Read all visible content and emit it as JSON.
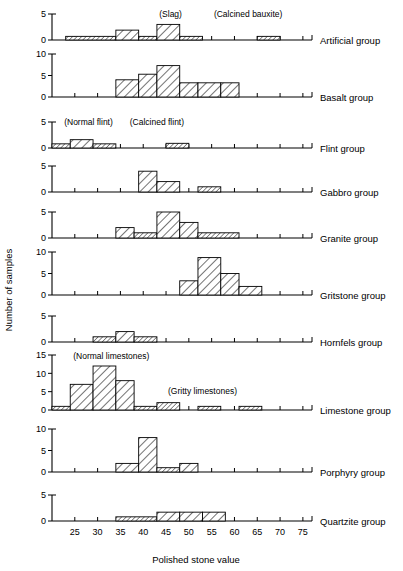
{
  "figure": {
    "xlabel": "Polished stone value",
    "ylabel": "Number of samples",
    "x_ticks": [
      25,
      30,
      35,
      40,
      45,
      50,
      55,
      60,
      65,
      70,
      75
    ],
    "x_range": [
      20,
      77
    ],
    "bin_width": 5
  },
  "chart_data": {
    "type": "bar",
    "title": "",
    "xlabel": "Polished stone value",
    "ylabel": "Number of samples",
    "xlim": [
      20,
      77
    ],
    "grid": false,
    "legend": "none",
    "xtick_labels": [
      "25",
      "30",
      "35",
      "40",
      "45",
      "50",
      "55",
      "60",
      "65",
      "70",
      "75"
    ],
    "panels": [
      {
        "name": "Artificial group",
        "label": "Artificial group",
        "ylim": [
          0,
          5
        ],
        "yticks": [
          0,
          5
        ],
        "ytick_labels": [
          "0",
          "5"
        ],
        "annotations": [
          {
            "text": "(Slag)",
            "x": 46,
            "y": 4.4
          },
          {
            "text": "(Calcined bauxite)",
            "x": 63,
            "y": 4.4
          }
        ],
        "bins": [
          {
            "x0": 23,
            "x1": 34,
            "value": 0.7
          },
          {
            "x0": 34,
            "x1": 39,
            "value": 1.9
          },
          {
            "x0": 39,
            "x1": 43,
            "value": 0.7
          },
          {
            "x0": 43,
            "x1": 48,
            "value": 3.0
          },
          {
            "x0": 48,
            "x1": 53,
            "value": 0.7
          },
          {
            "x0": 65,
            "x1": 70,
            "value": 0.7
          }
        ]
      },
      {
        "name": "Basalt group",
        "label": "Basalt group",
        "ylim": [
          0,
          10
        ],
        "yticks": [
          0,
          5,
          10
        ],
        "ytick_labels": [
          "0",
          "5",
          "10"
        ],
        "annotations": [],
        "bins": [
          {
            "x0": 34,
            "x1": 39,
            "value": 4.0
          },
          {
            "x0": 39,
            "x1": 43,
            "value": 5.3
          },
          {
            "x0": 43,
            "x1": 48,
            "value": 7.3
          },
          {
            "x0": 48,
            "x1": 52,
            "value": 3.3
          },
          {
            "x0": 52,
            "x1": 57,
            "value": 3.3
          },
          {
            "x0": 57,
            "x1": 61,
            "value": 3.3
          }
        ]
      },
      {
        "name": "Flint group",
        "label": "Flint group",
        "ylim": [
          0,
          5
        ],
        "yticks": [
          0,
          5
        ],
        "ytick_labels": [
          "0",
          "5"
        ],
        "annotations": [
          {
            "text": "(Normal flint)",
            "x": 28,
            "y": 4.4
          },
          {
            "text": "(Calcined flint)",
            "x": 43,
            "y": 4.4
          }
        ],
        "bins": [
          {
            "x0": 20,
            "x1": 24,
            "value": 0.8
          },
          {
            "x0": 24,
            "x1": 29,
            "value": 1.6
          },
          {
            "x0": 29,
            "x1": 34,
            "value": 0.8
          },
          {
            "x0": 45,
            "x1": 50,
            "value": 0.9
          }
        ]
      },
      {
        "name": "Gabbro group",
        "label": "Gabbro group",
        "ylim": [
          0,
          5
        ],
        "yticks": [
          0,
          5
        ],
        "ytick_labels": [
          "0",
          "5"
        ],
        "annotations": [],
        "bins": [
          {
            "x0": 39,
            "x1": 43,
            "value": 4.0
          },
          {
            "x0": 43,
            "x1": 48,
            "value": 2.0
          },
          {
            "x0": 52,
            "x1": 57,
            "value": 1.0
          }
        ]
      },
      {
        "name": "Granite group",
        "label": "Granite group",
        "ylim": [
          0,
          5
        ],
        "yticks": [
          0,
          5
        ],
        "ytick_labels": [
          "0",
          "5"
        ],
        "annotations": [],
        "bins": [
          {
            "x0": 34,
            "x1": 38,
            "value": 2.0
          },
          {
            "x0": 38,
            "x1": 43,
            "value": 1.0
          },
          {
            "x0": 43,
            "x1": 48,
            "value": 5.0
          },
          {
            "x0": 48,
            "x1": 52,
            "value": 3.0
          },
          {
            "x0": 52,
            "x1": 61,
            "value": 1.0
          }
        ]
      },
      {
        "name": "Gritstone group",
        "label": "Gritstone group",
        "ylim": [
          0,
          10
        ],
        "yticks": [
          0,
          5,
          10
        ],
        "ytick_labels": [
          "0",
          "5",
          "10"
        ],
        "annotations": [],
        "bins": [
          {
            "x0": 48,
            "x1": 52,
            "value": 3.3
          },
          {
            "x0": 52,
            "x1": 57,
            "value": 8.7
          },
          {
            "x0": 57,
            "x1": 61,
            "value": 5.0
          },
          {
            "x0": 61,
            "x1": 66,
            "value": 2.0
          }
        ]
      },
      {
        "name": "Hornfels group",
        "label": "Hornfels group",
        "ylim": [
          0,
          5
        ],
        "yticks": [
          0,
          5
        ],
        "ytick_labels": [
          "0",
          "5"
        ],
        "annotations": [],
        "bins": [
          {
            "x0": 29,
            "x1": 34,
            "value": 1.0
          },
          {
            "x0": 34,
            "x1": 38,
            "value": 2.0
          },
          {
            "x0": 38,
            "x1": 43,
            "value": 1.0
          }
        ]
      },
      {
        "name": "Limestone group",
        "label": "Limestone group",
        "ylim": [
          0,
          15
        ],
        "yticks": [
          0,
          5,
          10,
          15
        ],
        "ytick_labels": [
          "0",
          "5",
          "10",
          "15"
        ],
        "annotations": [
          {
            "text": "(Normal limestones)",
            "x": 33,
            "y": 14.0
          },
          {
            "text": "(Gritty limestones)",
            "x": 53,
            "y": 4.4
          }
        ],
        "bins": [
          {
            "x0": 20,
            "x1": 24,
            "value": 1.0
          },
          {
            "x0": 24,
            "x1": 29,
            "value": 7.0
          },
          {
            "x0": 29,
            "x1": 34,
            "value": 12.0
          },
          {
            "x0": 34,
            "x1": 38,
            "value": 8.0
          },
          {
            "x0": 38,
            "x1": 43,
            "value": 1.0
          },
          {
            "x0": 43,
            "x1": 48,
            "value": 2.0
          },
          {
            "x0": 52,
            "x1": 57,
            "value": 1.0
          },
          {
            "x0": 61,
            "x1": 66,
            "value": 1.0
          }
        ]
      },
      {
        "name": "Porphyry group",
        "label": "Porphyry group",
        "ylim": [
          0,
          10
        ],
        "yticks": [
          0,
          5,
          10
        ],
        "ytick_labels": [
          "0",
          "5",
          "10"
        ],
        "annotations": [],
        "bins": [
          {
            "x0": 34,
            "x1": 39,
            "value": 2.0
          },
          {
            "x0": 39,
            "x1": 43,
            "value": 8.0
          },
          {
            "x0": 43,
            "x1": 48,
            "value": 1.0
          },
          {
            "x0": 48,
            "x1": 52,
            "value": 2.0
          }
        ]
      },
      {
        "name": "Quartzite group",
        "label": "Quartzite group",
        "ylim": [
          0,
          5
        ],
        "yticks": [
          0,
          5
        ],
        "ytick_labels": [
          "0",
          "5"
        ],
        "annotations": [],
        "bins": [
          {
            "x0": 34,
            "x1": 43,
            "value": 0.8
          },
          {
            "x0": 43,
            "x1": 48,
            "value": 1.7
          },
          {
            "x0": 48,
            "x1": 53,
            "value": 1.7
          },
          {
            "x0": 53,
            "x1": 58,
            "value": 1.7
          }
        ]
      }
    ]
  }
}
